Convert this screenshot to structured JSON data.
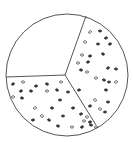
{
  "diagram": {
    "type": "circle-divided-into-three-sectors",
    "circle": {
      "cx": 67,
      "cy": 75,
      "r": 61
    },
    "center_point": {
      "x": 65,
      "y": 75
    },
    "colors": {
      "outline": "#555555",
      "dot": "#333333",
      "background": "#ffffff"
    },
    "dividers": [
      {
        "name": "divider-top-right",
        "x2": 86,
        "y2": 16
      },
      {
        "name": "divider-left",
        "x2": 6,
        "y2": 77
      },
      {
        "name": "divider-bottom-right",
        "x2": 96,
        "y2": 125
      }
    ],
    "sectors": [
      {
        "name": "sector-top-left",
        "filled": false
      },
      {
        "name": "sector-right",
        "filled": true
      },
      {
        "name": "sector-bottom-left",
        "filled": true
      }
    ],
    "dots": [
      [
        90,
        32
      ],
      [
        100,
        31
      ],
      [
        106,
        38
      ],
      [
        85,
        42
      ],
      [
        98,
        44
      ],
      [
        110,
        44
      ],
      [
        82,
        55
      ],
      [
        90,
        56
      ],
      [
        103,
        54
      ],
      [
        78,
        63
      ],
      [
        88,
        62
      ],
      [
        81,
        70
      ],
      [
        87,
        72
      ],
      [
        108,
        68
      ],
      [
        116,
        69
      ],
      [
        96,
        78
      ],
      [
        104,
        80
      ],
      [
        109,
        82
      ],
      [
        116,
        82
      ],
      [
        106,
        90
      ],
      [
        79,
        90
      ],
      [
        95,
        100
      ],
      [
        108,
        102
      ],
      [
        90,
        106
      ],
      [
        100,
        109
      ],
      [
        105,
        112
      ],
      [
        13,
        84
      ],
      [
        23,
        82
      ],
      [
        36,
        86
      ],
      [
        47,
        84
      ],
      [
        61,
        82
      ],
      [
        21,
        91
      ],
      [
        31,
        91
      ],
      [
        47,
        91
      ],
      [
        57,
        90
      ],
      [
        68,
        92
      ],
      [
        13,
        97
      ],
      [
        22,
        98
      ],
      [
        60,
        100
      ],
      [
        35,
        108
      ],
      [
        52,
        108
      ],
      [
        73,
        108
      ],
      [
        42,
        116
      ],
      [
        63,
        116
      ],
      [
        81,
        114
      ],
      [
        87,
        117
      ],
      [
        33,
        120
      ],
      [
        49,
        120
      ],
      [
        84,
        121
      ],
      [
        90,
        122
      ],
      [
        58,
        126
      ],
      [
        72,
        127
      ],
      [
        82,
        127
      ],
      [
        91,
        125
      ],
      [
        96,
        127
      ]
    ]
  }
}
